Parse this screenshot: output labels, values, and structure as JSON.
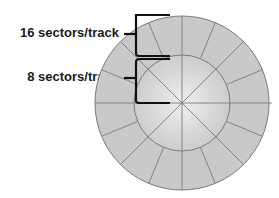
{
  "diagram": {
    "labels": {
      "outer_track": "16 sectors/track",
      "inner_track": "8 sectors/track"
    },
    "outer_track_sectors": 16,
    "inner_track_sectors": 8,
    "colors": {
      "disk_fill": "#c9c9c9",
      "disk_highlight": "#ececec",
      "sector_lines": "#7a7a7a",
      "bracket": "#111111",
      "text": "#1a1a1a"
    }
  }
}
